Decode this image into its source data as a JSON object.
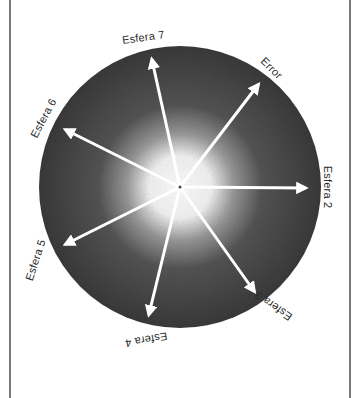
{
  "diagram": {
    "center": {
      "x": 180,
      "y": 187
    },
    "radius": 141,
    "colors": {
      "disc_outer": "#3c3c3c",
      "disc_mid": "#5a5a5a",
      "disc_center": "#ffffff",
      "arrow": "#ffffff",
      "frame": "#7a7a7a",
      "label": "#2a2a2a"
    },
    "arrows": [
      {
        "label": "Esfera 7",
        "tip": {
          "x": 152,
          "y": 55
        }
      },
      {
        "label": "Error",
        "tip": {
          "x": 262,
          "y": 80
        }
      },
      {
        "label": "Esfera 6",
        "tip": {
          "x": 61,
          "y": 128
        }
      },
      {
        "label": "Esfera 2",
        "tip": {
          "x": 310,
          "y": 188
        }
      },
      {
        "label": "Esfera 5",
        "tip": {
          "x": 61,
          "y": 246
        }
      },
      {
        "label": "Esfera 3",
        "tip": {
          "x": 257,
          "y": 295
        }
      },
      {
        "label": "Esfera 4",
        "tip": {
          "x": 148,
          "y": 319
        }
      }
    ],
    "labels": {
      "esfera7": "Esfera 7",
      "error": "Error",
      "esfera6": "Esfera 6",
      "esfera2": "Esfera 2",
      "esfera5": "Esfera 5",
      "esfera3": "Esfera 3",
      "esfera4": "Esfera 4"
    }
  }
}
